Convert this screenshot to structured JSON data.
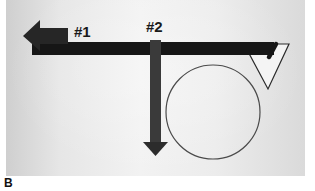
{
  "figure": {
    "panel_label": "B",
    "labels": {
      "arrow_1": "#1",
      "arrow_2": "#2"
    },
    "colors": {
      "beam": "#161616",
      "arrow_1": "#262626",
      "arrow_2": "#3a3a3a",
      "outline": "#444444",
      "background": "#ebebeb"
    },
    "elements": [
      {
        "name": "horizontal-beam",
        "description": "black horizontal bar"
      },
      {
        "name": "arrow-1",
        "description": "leftward arrow labeled #1"
      },
      {
        "name": "arrow-2",
        "description": "downward arrow labeled #2"
      },
      {
        "name": "circle",
        "description": "circle outline below beam"
      },
      {
        "name": "triangle",
        "description": "downward-pointing triangle outline at right end of beam"
      }
    ]
  }
}
